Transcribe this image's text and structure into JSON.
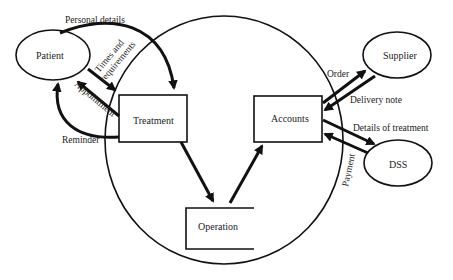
{
  "diagram": {
    "type": "context data flow diagram",
    "system_boundary": {
      "shape": "ellipse"
    },
    "external_entities": [
      {
        "id": "patient",
        "label": "Patient"
      },
      {
        "id": "supplier",
        "label": "Supplier"
      },
      {
        "id": "dss",
        "label": "DSS"
      }
    ],
    "processes": [
      {
        "id": "treatment",
        "label": "Treatment"
      },
      {
        "id": "accounts",
        "label": "Accounts"
      }
    ],
    "data_stores": [
      {
        "id": "operation",
        "label": "Operation"
      }
    ],
    "flows": [
      {
        "label": "Personal details",
        "from": "Patient",
        "to": "Treatment"
      },
      {
        "label": "Times and requirements",
        "line1": "Times and",
        "line2": "requirements",
        "from": "Treatment",
        "to": "Patient"
      },
      {
        "label": "Appointment",
        "from": "Treatment",
        "to": "Patient"
      },
      {
        "label": "Reminder",
        "from": "Treatment",
        "to": "Patient"
      },
      {
        "label": "",
        "from": "Treatment",
        "to": "Operation"
      },
      {
        "label": "",
        "from": "Operation",
        "to": "Accounts"
      },
      {
        "label": "Order",
        "from": "Accounts",
        "to": "Supplier"
      },
      {
        "label": "Delivery note",
        "from": "Supplier",
        "to": "Accounts"
      },
      {
        "label": "Details of treatment",
        "from": "Accounts",
        "to": "DSS"
      },
      {
        "label": "Payment",
        "from": "DSS",
        "to": "Accounts"
      }
    ]
  }
}
